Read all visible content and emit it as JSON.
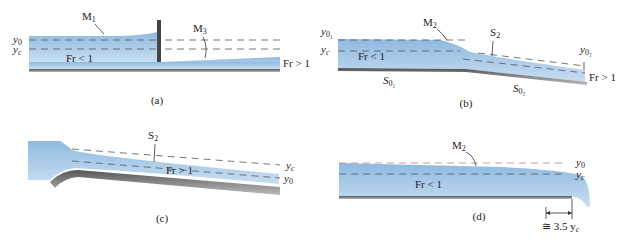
{
  "figure": {
    "panels": [
      {
        "id": "a",
        "caption": "(a)",
        "labels": {
          "profile_upstream": "M",
          "profile_upstream_sub": "1",
          "profile_downstream": "M",
          "profile_downstream_sub": "3",
          "y0": "y",
          "y0_sub": "0",
          "yc": "y",
          "yc_sub": "c",
          "froude_left": "Fr < 1",
          "froude_right": "Fr > 1"
        }
      },
      {
        "id": "b",
        "caption": "(b)",
        "labels": {
          "profile1": "M",
          "profile1_sub": "2",
          "profile2": "S",
          "profile2_sub": "2",
          "y01": "y",
          "y01_sub": "0₁",
          "yc": "y",
          "yc_sub": "c",
          "y02": "y",
          "y02_sub": "0₂",
          "froude_left": "Fr < 1",
          "froude_right": "Fr > 1",
          "slope1": "S",
          "slope1_sub": "0₁",
          "slope2": "S",
          "slope2_sub": "0₂"
        }
      },
      {
        "id": "c",
        "caption": "(c)",
        "labels": {
          "profile": "S",
          "profile_sub": "2",
          "yc": "y",
          "yc_sub": "c",
          "y0": "y",
          "y0_sub": "0",
          "froude": "Fr > 1"
        }
      },
      {
        "id": "d",
        "caption": "(d)",
        "labels": {
          "profile": "M",
          "profile_sub": "2",
          "y0": "y",
          "y0_sub": "0",
          "yc": "y",
          "yc_sub": "c",
          "froude": "Fr < 1",
          "distance": "≅ 3.5 y",
          "distance_sub": "c"
        }
      }
    ]
  }
}
